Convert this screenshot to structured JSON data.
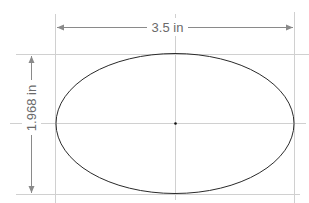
{
  "diagram": {
    "shape": "ellipse",
    "width_label": "3.5 in",
    "height_label": "1.968 in",
    "colors": {
      "outline": "#2a2a2a",
      "guide": "#c8c8c8",
      "dimension": "#8a8a8a",
      "text": "#6a6a6a",
      "center_dot": "#111111"
    }
  }
}
